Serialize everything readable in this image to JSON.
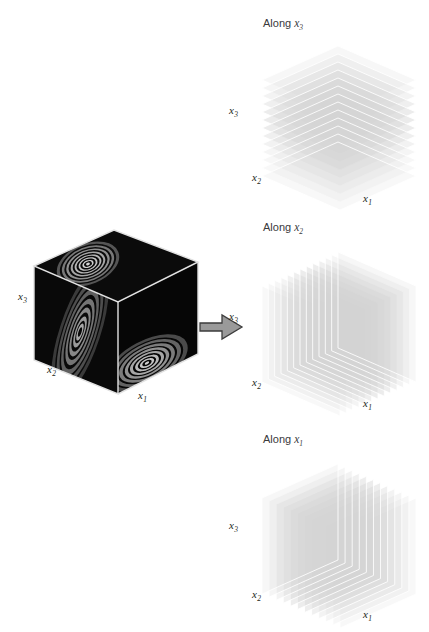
{
  "figure": {
    "background": "#ffffff",
    "caption_absent": true
  },
  "source_cube": {
    "name": "volume-cube",
    "face_color": "#0a0a0a",
    "edge_color": "#d8d8d8",
    "contour_color": "#b9b9b9",
    "axes": [
      {
        "id": "x3",
        "label": "x",
        "sub": "3",
        "x": 18,
        "y": 297
      },
      {
        "id": "x2",
        "label": "x",
        "sub": "2",
        "x": 48,
        "y": 370
      },
      {
        "id": "x1",
        "label": "x",
        "sub": "1",
        "x": 139,
        "y": 396
      }
    ],
    "contour_levels": [
      1,
      2,
      3,
      4,
      5,
      6,
      7
    ],
    "description": "Dark cube containing grayscale concentric elliptical contour blobs"
  },
  "arrow": {
    "name": "transform-arrow",
    "direction": "right",
    "fill": "#9a9a9a",
    "stroke": "#3d3d3d"
  },
  "panels": [
    {
      "id": "along-x3",
      "title_prefix": "Along ",
      "title_var": "x",
      "title_sub": "3",
      "slice_axis": "x3",
      "slice_count": 13,
      "orientation": "horizontal",
      "slice_fill": "#d4d4d4",
      "slice_edge": "#ffffff",
      "axes": [
        {
          "id": "x3",
          "label": "x",
          "sub": "3",
          "x": 229,
          "y": 105
        },
        {
          "id": "x2",
          "label": "x",
          "sub": "2",
          "x": 252,
          "y": 174
        },
        {
          "id": "x1",
          "label": "x",
          "sub": "1",
          "x": 363,
          "y": 196
        }
      ]
    },
    {
      "id": "along-x2",
      "title_prefix": "Along ",
      "title_var": "x",
      "title_sub": "2",
      "slice_axis": "x2",
      "slice_count": 13,
      "orientation": "depth",
      "slice_fill": "#d4d4d4",
      "slice_edge": "#ffffff",
      "axes": [
        {
          "id": "x3",
          "label": "x",
          "sub": "3",
          "x": 229,
          "y": 314
        },
        {
          "id": "x2",
          "label": "x",
          "sub": "2",
          "x": 252,
          "y": 379
        },
        {
          "id": "x1",
          "label": "x",
          "sub": "1",
          "x": 363,
          "y": 401
        }
      ]
    },
    {
      "id": "along-x1",
      "title_prefix": "Along ",
      "title_var": "x",
      "title_sub": "1",
      "slice_axis": "x1",
      "slice_count": 12,
      "orientation": "vertical",
      "slice_fill": "#d4d4d4",
      "slice_edge": "#ffffff",
      "axes": [
        {
          "id": "x3",
          "label": "x",
          "sub": "3",
          "x": 229,
          "y": 523
        },
        {
          "id": "x2",
          "label": "x",
          "sub": "2",
          "x": 252,
          "y": 592
        },
        {
          "id": "x1",
          "label": "x",
          "sub": "1",
          "x": 363,
          "y": 612
        }
      ]
    }
  ],
  "titles": {
    "along_x3": {
      "x": 263,
      "y": 18
    },
    "along_x2": {
      "x": 263,
      "y": 222
    },
    "along_x1": {
      "x": 263,
      "y": 434
    }
  }
}
